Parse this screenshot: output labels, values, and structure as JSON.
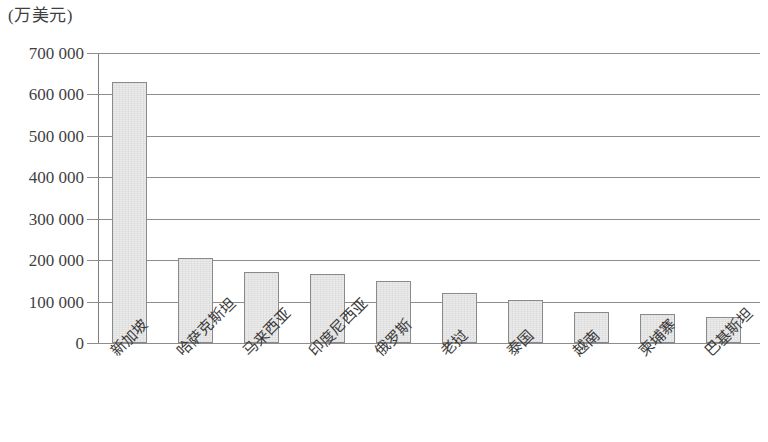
{
  "chart_data": {
    "type": "bar",
    "title": "",
    "subtitle": "",
    "unit_label": "(万美元)",
    "xlabel": "",
    "ylabel": "",
    "ylim": [
      0,
      700000
    ],
    "ytick_values": [
      0,
      100000,
      200000,
      300000,
      400000,
      500000,
      600000,
      700000
    ],
    "ytick_labels": [
      "0",
      "100 000",
      "200 000",
      "300 000",
      "400 000",
      "500 000",
      "600 000",
      "700 000"
    ],
    "grid": true,
    "legend": null,
    "legend_position": "none",
    "bar_fill_color": "#ebebeb",
    "bar_border_color": "#8a8a8a",
    "gridline_color": "#8d8d8d",
    "categories": [
      "新加坡",
      "哈萨克斯坦",
      "马来西亚",
      "印度尼西亚",
      "俄罗斯",
      "老挝",
      "泰国",
      "越南",
      "柬埔寨",
      "巴基斯坦"
    ],
    "values": [
      630000,
      206000,
      172000,
      167000,
      150000,
      120000,
      103000,
      75000,
      71000,
      62000
    ],
    "series": [
      {
        "name": "对外投资额",
        "values": [
          630000,
          206000,
          172000,
          167000,
          150000,
          120000,
          103000,
          75000,
          71000,
          62000
        ]
      }
    ]
  }
}
